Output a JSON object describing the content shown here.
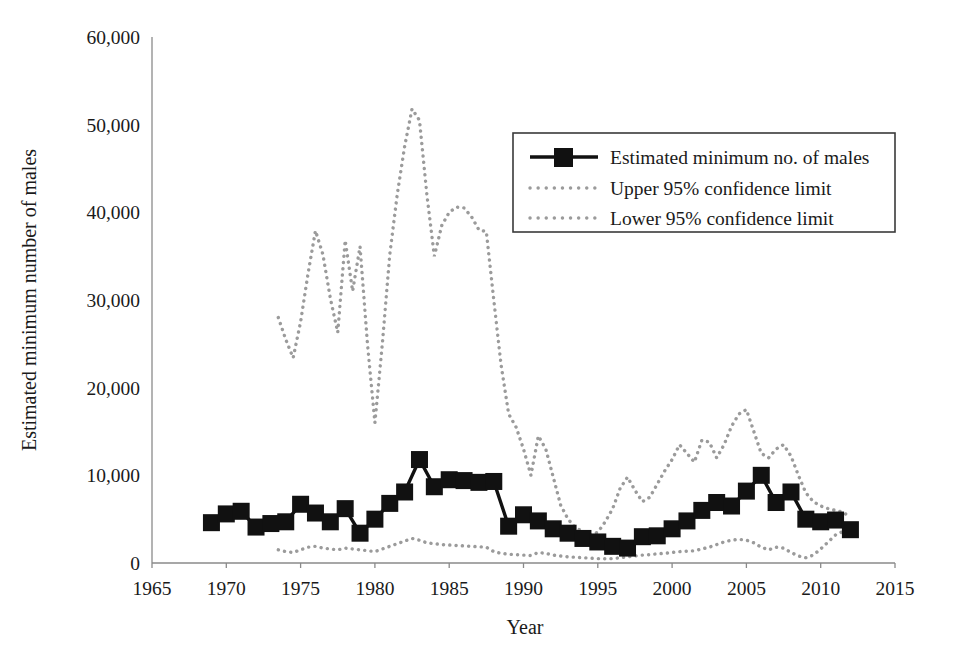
{
  "chart_data": {
    "type": "line",
    "title": "",
    "xlabel": "Year",
    "ylabel": "Estimated minimum number of males",
    "xlim": [
      1965,
      2015
    ],
    "ylim": [
      0,
      60000
    ],
    "xticks": [
      1965,
      1970,
      1975,
      1980,
      1985,
      1990,
      1995,
      2000,
      2005,
      2010,
      2015
    ],
    "xtick_labels": [
      "1965",
      "1970",
      "1975",
      "1980",
      "1985",
      "1990",
      "1995",
      "2000",
      "2005",
      "2010",
      "2015"
    ],
    "yticks": [
      0,
      10000,
      20000,
      30000,
      40000,
      50000,
      60000
    ],
    "ytick_labels": [
      "0",
      "10,000",
      "20,000",
      "30,000",
      "40,000",
      "50,000",
      "60,000"
    ],
    "grid": false,
    "legend_position": "upper right",
    "series": [
      {
        "name": "Estimated minimum no. of males",
        "style": "solid-line-square-markers",
        "color": "#111111",
        "x": [
          1969,
          1970,
          1971,
          1972,
          1973,
          1974,
          1975,
          1976,
          1977,
          1978,
          1979,
          1980,
          1981,
          1982,
          1983,
          1984,
          1985,
          1986,
          1987,
          1988,
          1989,
          1990,
          1991,
          1992,
          1993,
          1994,
          1995,
          1996,
          1997,
          1998,
          1999,
          2000,
          2001,
          2002,
          2003,
          2004,
          2005,
          2006,
          2007,
          2008,
          2009,
          2010,
          2011,
          2012
        ],
        "values": [
          4600,
          5600,
          5900,
          4100,
          4500,
          4700,
          6700,
          5700,
          4700,
          6200,
          3400,
          5000,
          6800,
          8100,
          11800,
          8700,
          9500,
          9400,
          9200,
          9300,
          4200,
          5500,
          4800,
          3900,
          3400,
          2800,
          2400,
          1900,
          1700,
          3000,
          3100,
          3900,
          4800,
          6000,
          6900,
          6500,
          8200,
          10000,
          6900,
          8100,
          5000,
          4700,
          4900,
          3800
        ]
      },
      {
        "name": "Upper 95% confidence limit",
        "style": "dotted-line",
        "color": "#9b9b9b",
        "x": [
          1973.5,
          1974,
          1974.5,
          1975,
          1975.5,
          1976,
          1976.5,
          1977,
          1977.5,
          1978,
          1978.5,
          1979,
          1979.5,
          1980,
          1980.5,
          1981,
          1981.5,
          1982,
          1982.5,
          1983,
          1983.5,
          1984,
          1984.5,
          1985,
          1985.5,
          1986,
          1986.5,
          1987,
          1987.5,
          1988,
          1988.5,
          1989,
          1989.5,
          1990,
          1990.5,
          1991,
          1991.5,
          1992,
          1992.5,
          1993,
          1993.5,
          1994,
          1994.5,
          1995,
          1995.5,
          1996,
          1996.5,
          1997,
          1997.5,
          1998,
          1998.5,
          1999,
          1999.5,
          2000,
          2000.5,
          2001,
          2001.5,
          2002,
          2002.5,
          2003,
          2003.5,
          2004,
          2004.5,
          2005,
          2005.5,
          2006,
          2006.5,
          2007,
          2007.5,
          2008,
          2008.5,
          2009,
          2009.5,
          2010,
          2010.5,
          2011,
          2011.5,
          2012
        ],
        "values": [
          28000,
          25500,
          23400,
          27500,
          33000,
          37900,
          35200,
          30200,
          26300,
          36800,
          31000,
          36100,
          25000,
          16000,
          25000,
          35200,
          42000,
          47500,
          51800,
          50500,
          42000,
          35000,
          38500,
          40000,
          40600,
          40500,
          39500,
          38000,
          37800,
          30000,
          22500,
          17000,
          15500,
          13000,
          10000,
          14500,
          13000,
          9800,
          6600,
          5000,
          4000,
          3600,
          3200,
          3500,
          4700,
          6200,
          8500,
          9800,
          8300,
          7000,
          7500,
          9000,
          10500,
          11800,
          13500,
          12500,
          11500,
          14000,
          13800,
          12000,
          13500,
          15600,
          17000,
          17500,
          15000,
          12500,
          12000,
          13000,
          13500,
          12200,
          10000,
          8000,
          7000,
          6500,
          6200,
          6000,
          5800,
          5200
        ]
      },
      {
        "name": "Lower 95% confidence limit",
        "style": "dotted-line",
        "color": "#9b9b9b",
        "x": [
          1973.5,
          1974,
          1974.5,
          1975,
          1975.5,
          1976,
          1976.5,
          1977,
          1977.5,
          1978,
          1978.5,
          1979,
          1979.5,
          1980,
          1980.5,
          1981,
          1981.5,
          1982,
          1982.5,
          1983,
          1983.5,
          1984,
          1984.5,
          1985,
          1985.5,
          1986,
          1986.5,
          1987,
          1987.5,
          1988,
          1988.5,
          1989,
          1989.5,
          1990,
          1990.5,
          1991,
          1991.5,
          1992,
          1992.5,
          1993,
          1993.5,
          1994,
          1994.5,
          1995,
          1995.5,
          1996,
          1996.5,
          1997,
          1997.5,
          1998,
          1998.5,
          1999,
          1999.5,
          2000,
          2000.5,
          2001,
          2001.5,
          2002,
          2002.5,
          2003,
          2003.5,
          2004,
          2004.5,
          2005,
          2005.5,
          2006,
          2006.5,
          2007,
          2007.5,
          2008,
          2008.5,
          2009,
          2009.5,
          2010,
          2010.5,
          2011,
          2011.5,
          2012
        ],
        "values": [
          1500,
          1300,
          1200,
          1500,
          1800,
          1900,
          1700,
          1600,
          1500,
          1700,
          1600,
          1500,
          1400,
          1300,
          1600,
          1900,
          2200,
          2500,
          2800,
          2600,
          2300,
          2200,
          2100,
          2050,
          2000,
          1950,
          1900,
          1850,
          1800,
          1300,
          1100,
          1000,
          950,
          900,
          850,
          1200,
          1100,
          900,
          800,
          700,
          650,
          600,
          550,
          500,
          480,
          500,
          600,
          700,
          800,
          900,
          950,
          1050,
          1100,
          1200,
          1300,
          1350,
          1400,
          1600,
          1800,
          2100,
          2400,
          2600,
          2700,
          2600,
          2300,
          1800,
          1500,
          1800,
          1700,
          1200,
          800,
          600,
          900,
          1600,
          2400,
          3200,
          3600,
          3800
        ]
      }
    ]
  },
  "legend": {
    "items": [
      {
        "label": "Estimated minimum no. of males",
        "marker": "line-with-square"
      },
      {
        "label": "Upper 95% confidence limit",
        "marker": "dotted-line"
      },
      {
        "label": "Lower 95% confidence limit",
        "marker": "dotted-line"
      }
    ]
  }
}
